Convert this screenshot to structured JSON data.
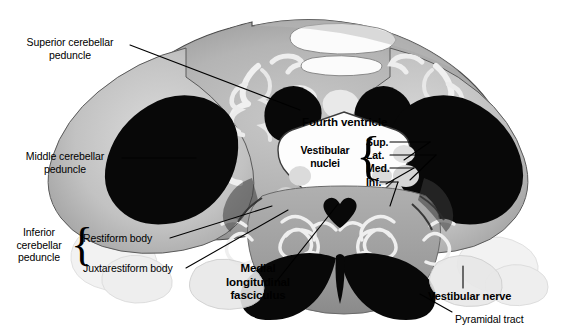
{
  "figure": {
    "background_color": "#ffffff",
    "width": 576,
    "height": 333
  },
  "labels": {
    "superior_cerebellar_peduncle": {
      "line1": "Superior cerebellar",
      "line2": "peduncle"
    },
    "middle_cerebellar_peduncle": {
      "line1": "Middle cerebellar",
      "line2": "peduncle"
    },
    "inferior_cerebellar_peduncle": {
      "line1": "Inferior",
      "line2": "cerebellar",
      "line3": "peduncle"
    },
    "restiform_body": "Restiform body",
    "juxtarestiform_body": "Juxtarestiform body",
    "fourth_ventricle": "Fourth ventricle",
    "vestibular_nuclei": {
      "line1": "Vestibular",
      "line2": "nuclei"
    },
    "vestibular_sup": "Sup.",
    "vestibular_lat": "Lat.",
    "vestibular_med": "Med.",
    "vestibular_inf": "Inf.",
    "medial_longitudinal_fasciculus": {
      "line1": "Medial",
      "line2": "longitudinal",
      "line3": "fasciculus"
    },
    "vestibular_nerve": "Vestibular nerve",
    "pyramidal_tract": "Pyramidal tract"
  },
  "colors": {
    "text": "#000000",
    "leader_line": "#000000",
    "tissue_light": "#d8d8d8",
    "tissue_mid": "#a8a8a8",
    "tissue_dark": "#6e6e6e",
    "tract_black": "#080808",
    "ventricle_white": "#fdfdfd",
    "outline": "#2a2a2a"
  },
  "structures": [
    {
      "name": "left-middle-cerebellar-peduncle",
      "type": "dark-tract"
    },
    {
      "name": "right-middle-cerebellar-peduncle",
      "type": "dark-tract"
    },
    {
      "name": "left-superior-cerebellar-peduncle",
      "type": "dark-tract"
    },
    {
      "name": "right-superior-cerebellar-peduncle",
      "type": "dark-tract"
    },
    {
      "name": "fourth-ventricle-cavity",
      "type": "ventricle"
    },
    {
      "name": "left-inferior-olivary-nucleus",
      "type": "convoluted-grey"
    },
    {
      "name": "right-inferior-olivary-nucleus",
      "type": "convoluted-grey"
    },
    {
      "name": "left-pyramid",
      "type": "dark-tract"
    },
    {
      "name": "right-pyramid",
      "type": "dark-tract"
    },
    {
      "name": "left-cerebellar-hemisphere",
      "type": "cerebellar-cortex"
    },
    {
      "name": "right-cerebellar-hemisphere",
      "type": "cerebellar-cortex"
    },
    {
      "name": "left-medial-longitudinal-fasciculus",
      "type": "dark-tract"
    },
    {
      "name": "right-medial-longitudinal-fasciculus",
      "type": "dark-tract"
    }
  ]
}
